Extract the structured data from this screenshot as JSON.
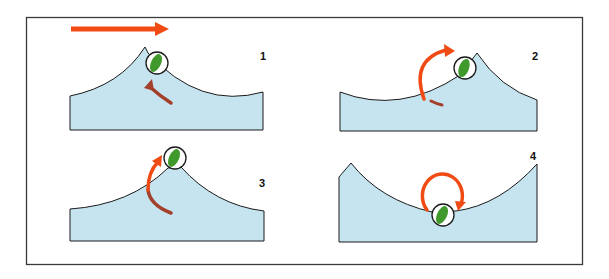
{
  "figure": {
    "colors": {
      "water": "#c6e4ef",
      "outline": "#1a1a1a",
      "ball_green": "#3f9a2b",
      "ball_highlight": "#e9f5e4",
      "arrow_orange": "#f04b15",
      "arrow_brown": "#a3402b",
      "frame": "#3a3a3a"
    },
    "direction_arrow": {
      "name": "wave-direction-arrow"
    },
    "panels": [
      {
        "id": 1,
        "label": "1"
      },
      {
        "id": 2,
        "label": "2"
      },
      {
        "id": 3,
        "label": "3"
      },
      {
        "id": 4,
        "label": "4"
      }
    ]
  }
}
